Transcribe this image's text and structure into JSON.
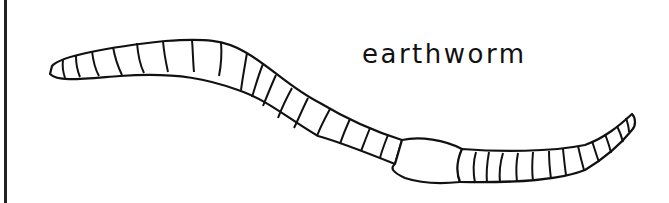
{
  "label": "earthworm",
  "colors": {
    "stroke": "#111111",
    "fill": "#ffffff",
    "background": "#ffffff"
  },
  "illustration": {
    "subject": "earthworm",
    "icon": "earthworm-line-drawing"
  }
}
